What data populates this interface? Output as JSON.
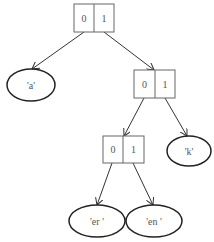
{
  "diagram": {
    "type": "huffman-trie",
    "internal_nodes": [
      {
        "id": "root",
        "left_label": "0",
        "right_label": "1"
      },
      {
        "id": "n1",
        "left_label": "0",
        "right_label": "1"
      },
      {
        "id": "n2",
        "left_label": "0",
        "right_label": "1"
      }
    ],
    "leaves": [
      {
        "id": "leaf-a",
        "label": "'a'"
      },
      {
        "id": "leaf-k",
        "label": "'k'"
      },
      {
        "id": "leaf-er",
        "label": "'er '"
      },
      {
        "id": "leaf-en",
        "label": "'en '"
      }
    ],
    "edges": [
      {
        "from": "root",
        "branch": "0",
        "to": "leaf-a"
      },
      {
        "from": "root",
        "branch": "1",
        "to": "n1"
      },
      {
        "from": "n1",
        "branch": "0",
        "to": "n2"
      },
      {
        "from": "n1",
        "branch": "1",
        "to": "leaf-k"
      },
      {
        "from": "n2",
        "branch": "0",
        "to": "leaf-er"
      },
      {
        "from": "n2",
        "branch": "1",
        "to": "leaf-en"
      }
    ]
  }
}
